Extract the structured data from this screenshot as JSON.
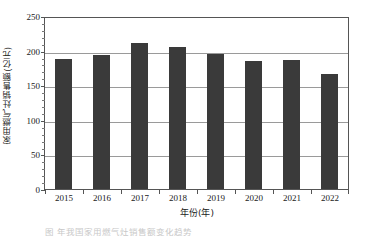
{
  "chart_data": {
    "type": "bar",
    "title": "",
    "subtitle": "",
    "xlabel": "年份(年)",
    "ylabel": "家用燃气灶销售额(亿元)",
    "categories": [
      "2015",
      "2016",
      "2017",
      "2018",
      "2019",
      "2020",
      "2021",
      "2022"
    ],
    "values": [
      190,
      196,
      213,
      207,
      198,
      187,
      189,
      168
    ],
    "series": [
      {
        "name": "家用燃气灶销售额",
        "values": [
          190,
          196,
          213,
          207,
          198,
          187,
          189,
          168
        ]
      }
    ],
    "ylim": [
      0,
      250
    ],
    "yticks": [
      0,
      50,
      100,
      150,
      200,
      250
    ],
    "ytick_labels": [
      "0",
      "50",
      "100",
      "150",
      "200",
      "250"
    ],
    "yminor_tick_step": 10,
    "grid": true,
    "grid_axis": "y",
    "legend": false,
    "legend_position": "none",
    "bar_color": "#3a3a3a",
    "grid_color": "#9a9a9a",
    "axis_color": "#555555",
    "background_color": "#ffffff"
  },
  "caption": {
    "text": "图    年我国家用燃气灶销售额变化趋势"
  }
}
